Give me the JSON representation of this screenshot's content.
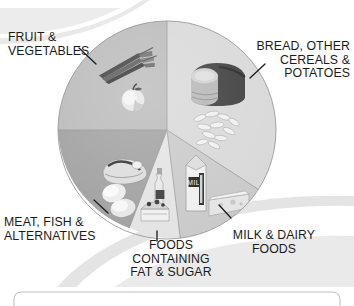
{
  "diagram": {
    "type": "pie",
    "center": {
      "x": 167,
      "y": 130
    },
    "radius": 109,
    "segments": [
      {
        "id": "fruit-vegetables",
        "label": "FRUIT &\nVEGETABLES",
        "label_lines": [
          "FRUIT &",
          "VEGETABLES"
        ],
        "share_percent": 33,
        "start_angle": 180,
        "end_angle": 270,
        "fill": "#b9b9b9",
        "foods": [
          "carrots",
          "apple"
        ]
      },
      {
        "id": "bread-cereals-potatoes",
        "label": "BREAD, OTHER\nCEREALS &\nPOTATOES",
        "label_lines": [
          "BREAD, OTHER",
          "CEREALS &",
          "POTATOES"
        ],
        "share_percent": 33,
        "start_angle": 270,
        "end_angle": 33,
        "fill": "#d8d8d8",
        "foods": [
          "bread-loaf",
          "pasta"
        ]
      },
      {
        "id": "milk-dairy-foods",
        "label": "MILK & DAIRY\nFOODS",
        "label_lines": [
          "MILK & DAIRY",
          "FOODS"
        ],
        "share_percent": 15,
        "start_angle": 33,
        "end_angle": 97,
        "fill": "#c9c9c9",
        "foods": [
          "milk-carton",
          "cheese-block"
        ]
      },
      {
        "id": "foods-containing-fat-and-sugar",
        "label": "FOODS\nCONTAINING\nFAT & SUGAR",
        "label_lines": [
          "FOODS",
          "CONTAINING",
          "FAT & SUGAR"
        ],
        "share_percent": 8,
        "start_angle": 97,
        "end_angle": 116,
        "fill": "#e3e3e3",
        "foods": [
          "oil-bottle",
          "cake"
        ]
      },
      {
        "id": "meat-fish-alternatives",
        "label": "MEAT, FISH &\nALTERNATIVES",
        "label_lines": [
          "MEAT, FISH &",
          "ALTERNATIVES"
        ],
        "share_percent": 12,
        "start_angle": 116,
        "end_angle": 180,
        "fill": "#9f9f9f",
        "foods": [
          "meat-joint",
          "eggs",
          "beans"
        ]
      }
    ],
    "leaders": [
      {
        "id": "leader-fruit",
        "x1": 79,
        "y1": 48,
        "x2": 96,
        "y2": 64
      },
      {
        "id": "leader-bread",
        "x1": 265,
        "y1": 64,
        "x2": 250,
        "y2": 78
      },
      {
        "id": "leader-milk",
        "x1": 231,
        "y1": 218,
        "x2": 219,
        "y2": 205
      },
      {
        "id": "leader-fatsugar",
        "x1": 157,
        "y1": 231,
        "x2": 157,
        "y2": 241
      },
      {
        "id": "leader-meat",
        "x1": 108,
        "y1": 213,
        "x2": 94,
        "y2": 200
      }
    ]
  },
  "colors": {
    "background": "#ffffff",
    "text": "#1a1a1a",
    "decor_light": "#e6e6e6",
    "decor_mid": "#d2d2d2",
    "outline": "#8a8a8a"
  }
}
